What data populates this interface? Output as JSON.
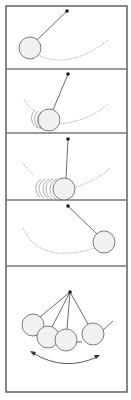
{
  "figure": {
    "title": "",
    "panel_count": 5,
    "panels": [
      {
        "id": 1,
        "phase": "bob raised to the left at start of swing",
        "motion_blur": false,
        "dashed_path": true
      },
      {
        "id": 2,
        "phase": "bob swinging down with motion trail",
        "motion_blur": true,
        "dashed_path": true
      },
      {
        "id": 3,
        "phase": "bob near bottom of swing with longer motion trail",
        "motion_blur": true,
        "dashed_path": true
      },
      {
        "id": 4,
        "phase": "bob raised to the right at end of swing",
        "motion_blur": false,
        "dashed_path": true
      },
      {
        "id": 5,
        "phase": "summary: multiple bob positions with double-headed arrow",
        "motion_blur": false,
        "dashed_path": false,
        "double_arrow": true
      }
    ],
    "colors": {
      "frame": "#6a6a6a",
      "bob_fill": "#f1f1f1",
      "pivot": "#1a1a1a"
    }
  }
}
